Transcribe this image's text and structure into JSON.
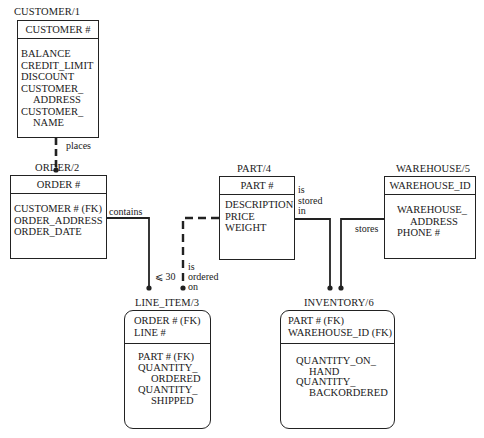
{
  "entities": {
    "customer": {
      "title": "CUSTOMER/1",
      "key": "CUSTOMER #",
      "attributes": [
        "BALANCE",
        "CREDIT_LIMIT",
        "DISCOUNT",
        "CUSTOMER_",
        "ADDRESS",
        "CUSTOMER_",
        "NAME"
      ]
    },
    "order": {
      "title": "ORDER/2",
      "key": "ORDER #",
      "attributes": [
        "CUSTOMER # (FK)",
        "ORDER_ADDRESS",
        "ORDER_DATE"
      ]
    },
    "line_item": {
      "title": "LINE_ITEM/3",
      "keys": [
        "ORDER # (FK)",
        "LINE #"
      ],
      "attributes": [
        "PART # (FK)",
        "QUANTITY_",
        "ORDERED",
        "QUANTITY_",
        "SHIPPED"
      ]
    },
    "part": {
      "title": "PART/4",
      "key": "PART #",
      "attributes": [
        "DESCRIPTION",
        "PRICE",
        "WEIGHT"
      ]
    },
    "warehouse": {
      "title": "WAREHOUSE/5",
      "key": "WAREHOUSE_ID",
      "attributes": [
        "WAREHOUSE_",
        "ADDRESS",
        "PHONE #"
      ]
    },
    "inventory": {
      "title": "INVENTORY/6",
      "keys": [
        "PART # (FK)",
        "WAREHOUSE_ID (FK)"
      ],
      "attributes": [
        "QUANTITY_ON_",
        "HAND",
        "QUANTITY_",
        "BACKORDERED"
      ]
    }
  },
  "relationships": {
    "places": {
      "label": "places",
      "from": "CUSTOMER/1",
      "to": "ORDER/2",
      "style": "dashed"
    },
    "contains": {
      "label": "contains",
      "from": "ORDER/2",
      "to": "LINE_ITEM/3",
      "style": "solid",
      "cardinality": "⩽ 30"
    },
    "is_ordered_on": {
      "label_lines": [
        "is",
        "ordered",
        "on"
      ],
      "from": "PART/4",
      "to": "LINE_ITEM/3",
      "style": "dashed"
    },
    "is_stored_in": {
      "label_lines": [
        "is",
        "stored",
        "in"
      ],
      "from": "PART/4",
      "to": "INVENTORY/6",
      "style": "solid"
    },
    "stores": {
      "label": "stores",
      "from": "WAREHOUSE/5",
      "to": "INVENTORY/6",
      "style": "solid"
    }
  },
  "colors": {
    "line": "#222222",
    "background": "#ffffff"
  }
}
